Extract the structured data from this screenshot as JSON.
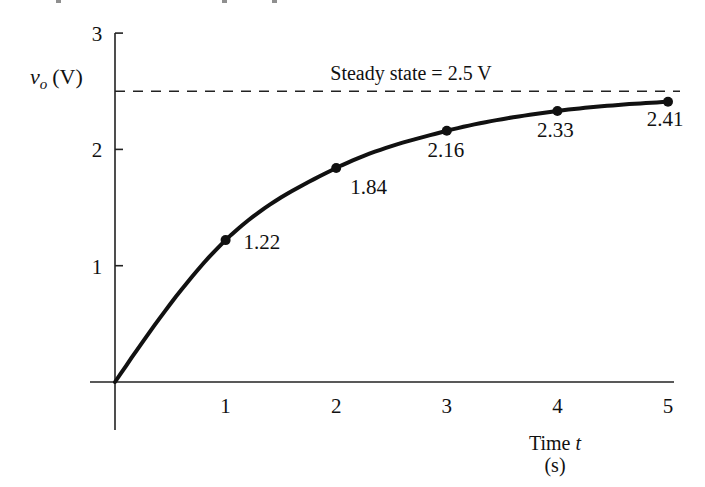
{
  "chart_data": {
    "type": "line",
    "title": "",
    "xlabel": "Time t",
    "xlabel_italic_part": "t",
    "xlabel_unit": "(s)",
    "ylabel": "v_o (V)",
    "ylabel_parts": {
      "main": "v",
      "sub": "o",
      "unit": "(V)"
    },
    "xlim": [
      0,
      5
    ],
    "ylim": [
      0,
      3
    ],
    "x_ticks": [
      1,
      2,
      3,
      4,
      5
    ],
    "y_ticks": [
      1,
      2,
      3
    ],
    "grid": false,
    "legend": null,
    "annotations": [
      {
        "text": "Steady state = 2.5 V",
        "type": "dashed-hline",
        "y": 2.5
      }
    ],
    "series": [
      {
        "name": "v_o(t)",
        "x": [
          0,
          1,
          2,
          3,
          4,
          5
        ],
        "values": [
          0,
          1.22,
          1.84,
          2.16,
          2.33,
          2.41
        ],
        "point_labels": [
          "",
          "1.22",
          "1.84",
          "2.16",
          "2.33",
          "2.41"
        ],
        "markers_at": [
          1,
          2,
          3,
          4,
          5
        ]
      }
    ],
    "steady_state": 2.5,
    "time_constant_approx": 1.45
  }
}
